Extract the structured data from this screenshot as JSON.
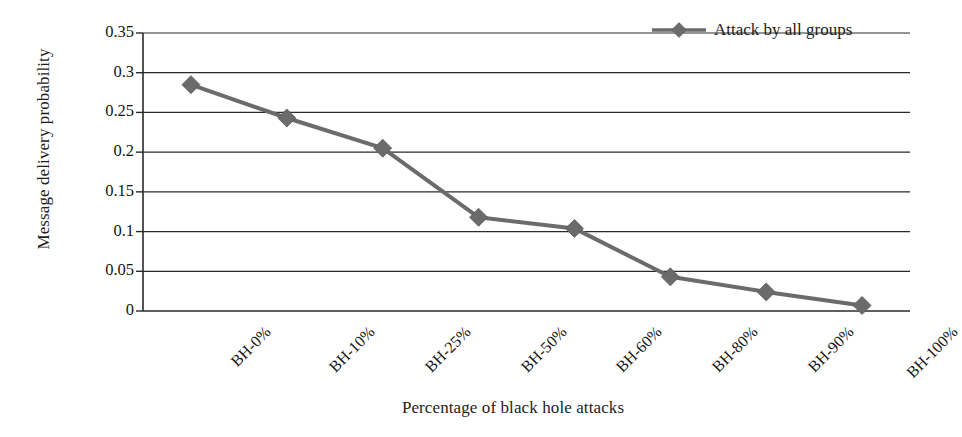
{
  "chart_data": {
    "type": "line",
    "title": "",
    "xlabel": "Percentage of black hole attacks",
    "ylabel": "Message delivery probability",
    "categories": [
      "BH-0%",
      "BH-10%",
      "BH-25%",
      "BH-50%",
      "BH-60%",
      "BH-80%",
      "BH-90%",
      "BH-100%"
    ],
    "series": [
      {
        "name": "Attack by all groups",
        "values": [
          0.285,
          0.243,
          0.205,
          0.118,
          0.104,
          0.043,
          0.024,
          0.007
        ],
        "color": "#6b6b6b",
        "marker": "diamond"
      }
    ],
    "ylim": [
      0,
      0.35
    ],
    "ytick_labels": [
      "0.35",
      "0.3",
      "0.25",
      "0.2",
      "0.15",
      "0.1",
      "0.05",
      "0"
    ],
    "ytick_values": [
      0.35,
      0.3,
      0.25,
      0.2,
      0.15,
      0.1,
      0.05,
      0
    ],
    "grid": "horizontal",
    "legend_position": "top-right",
    "legend_entries": [
      "Attack by all groups"
    ],
    "axis_color": "#2a2a2a",
    "background": "#ffffff"
  }
}
